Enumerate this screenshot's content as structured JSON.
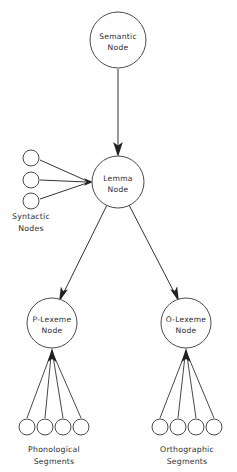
{
  "diagram": {
    "type": "lexical-access-network",
    "background_color": "#ffffff",
    "stroke_color": "#333333",
    "text_color": "#2e2e2e",
    "nodes": [
      {
        "id": "semantic",
        "line1": "Semantic",
        "line2": "Node",
        "cx": 118,
        "cy": 40,
        "r": 28
      },
      {
        "id": "lemma",
        "line1": "Lemma",
        "line2": "Node",
        "cx": 118,
        "cy": 182,
        "r": 26
      },
      {
        "id": "p-lexeme",
        "line1": "P-Lexeme",
        "line2": "Node",
        "cx": 52,
        "cy": 323,
        "r": 25
      },
      {
        "id": "o-lexeme",
        "line1": "O-Lexeme",
        "line2": "Node",
        "cx": 186,
        "cy": 323,
        "r": 25
      }
    ],
    "groups": [
      {
        "id": "syntactic",
        "line1": "Syntactic",
        "line2": "Nodes",
        "label_x": 31,
        "label_y": 216,
        "count": 3
      },
      {
        "id": "phonological",
        "line1": "Phonological",
        "line2": "Segments",
        "label_x": 54,
        "label_y": 449,
        "count": 4
      },
      {
        "id": "orthographic",
        "line1": "Orthographic",
        "line2": "Segments",
        "label_x": 187,
        "label_y": 449,
        "count": 4
      }
    ],
    "syntactic_circles": [
      {
        "cx": 31,
        "cy": 158,
        "r": 8
      },
      {
        "cx": 31,
        "cy": 180,
        "r": 8
      },
      {
        "cx": 31,
        "cy": 201,
        "r": 8
      }
    ],
    "phonological_circles": [
      {
        "cx": 27,
        "cy": 427,
        "r": 8
      },
      {
        "cx": 45,
        "cy": 427,
        "r": 8
      },
      {
        "cx": 63,
        "cy": 427,
        "r": 8
      },
      {
        "cx": 81,
        "cy": 427,
        "r": 8
      }
    ],
    "orthographic_circles": [
      {
        "cx": 160,
        "cy": 427,
        "r": 8
      },
      {
        "cx": 178,
        "cy": 427,
        "r": 8
      },
      {
        "cx": 196,
        "cy": 427,
        "r": 8
      },
      {
        "cx": 214,
        "cy": 427,
        "r": 8
      }
    ],
    "edges": [
      {
        "id": "semantic-to-lemma",
        "from": "semantic",
        "to": "lemma",
        "arrow": true
      },
      {
        "id": "syntactic-to-lemma",
        "from": "syntactic",
        "to": "lemma",
        "arrow": true
      },
      {
        "id": "lemma-to-p-lexeme",
        "from": "lemma",
        "to": "p-lexeme",
        "arrow": true
      },
      {
        "id": "lemma-to-o-lexeme",
        "from": "lemma",
        "to": "o-lexeme",
        "arrow": true
      },
      {
        "id": "phonological-to-p-lexeme",
        "from": "phonological",
        "to": "p-lexeme",
        "arrow": true
      },
      {
        "id": "orthographic-to-o-lexeme",
        "from": "orthographic",
        "to": "o-lexeme",
        "arrow": true
      }
    ]
  }
}
